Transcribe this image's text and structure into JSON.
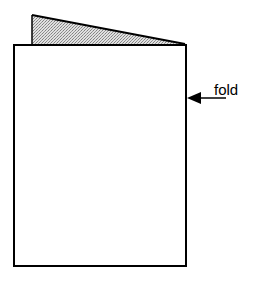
{
  "diagram": {
    "annotation": {
      "label": "fold",
      "icon": "left-arrow-icon"
    },
    "colors": {
      "stroke": "#000000",
      "fill_back_flap": "#c8c8c8",
      "background": "#ffffff"
    }
  }
}
